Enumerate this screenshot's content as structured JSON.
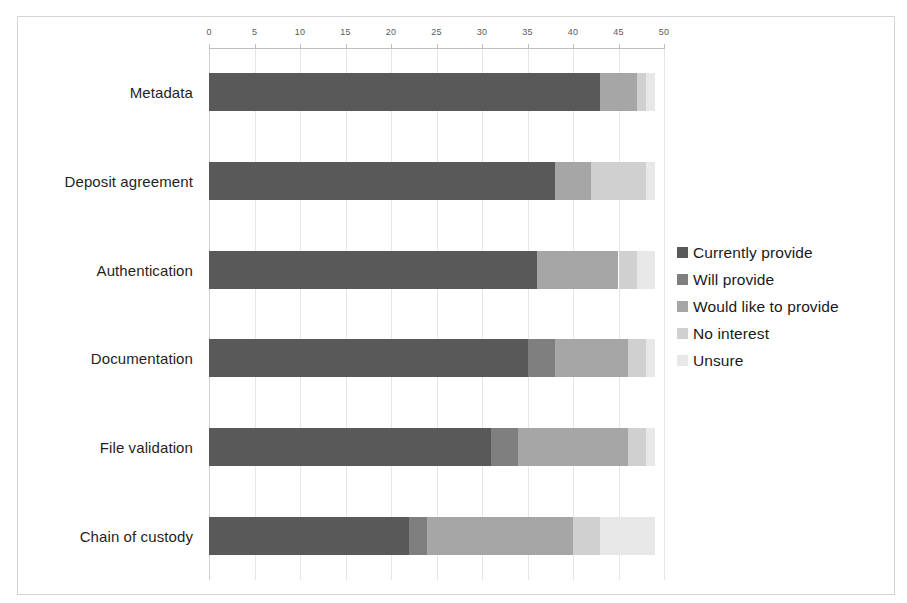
{
  "chart_data": {
    "type": "bar",
    "orientation": "horizontal",
    "stacked": true,
    "title": "",
    "xlabel": "",
    "ylabel": "",
    "xlim": [
      0,
      50
    ],
    "xticks": [
      0,
      5,
      10,
      15,
      20,
      25,
      30,
      35,
      40,
      45,
      50
    ],
    "grid": true,
    "legend_position": "right",
    "categories": [
      "Metadata",
      "Deposit agreement",
      "Authentication",
      "Documentation",
      "File validation",
      "Chain of custody"
    ],
    "series": [
      {
        "name": "Currently provide",
        "color": "#595959",
        "values": [
          43,
          38,
          36,
          35,
          31,
          22
        ]
      },
      {
        "name": "Will provide",
        "color": "#7f7f7f",
        "values": [
          0,
          0,
          0,
          3,
          3,
          2
        ]
      },
      {
        "name": "Would like to provide",
        "color": "#a6a6a6",
        "values": [
          4,
          4,
          9,
          8,
          12,
          16
        ]
      },
      {
        "name": "No interest",
        "color": "#d0d0d0",
        "values": [
          1,
          6,
          2,
          2,
          2,
          3
        ]
      },
      {
        "name": "Unsure",
        "color": "#e8e8e8",
        "values": [
          1,
          1,
          2,
          1,
          1,
          6
        ]
      }
    ]
  },
  "legend": {
    "items": [
      {
        "label": "Currently provide"
      },
      {
        "label": "Will provide"
      },
      {
        "label": "Would like to provide"
      },
      {
        "label": "No interest"
      },
      {
        "label": "Unsure"
      }
    ]
  }
}
